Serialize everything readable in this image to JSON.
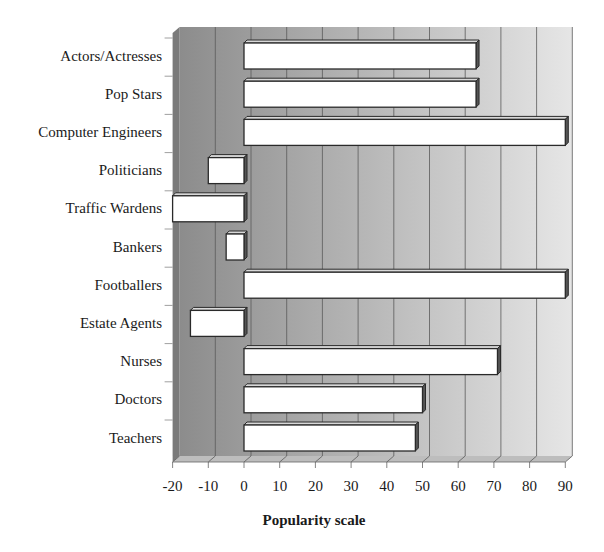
{
  "chart_data": {
    "type": "bar",
    "orientation": "horizontal",
    "style": "3d",
    "title": "",
    "xlabel": "Popularity scale",
    "ylabel": "",
    "categories": [
      "Actors/Actresses",
      "Pop Stars",
      "Computer Engineers",
      "Politicians",
      "Traffic Wardens",
      "Bankers",
      "Footballers",
      "Estate Agents",
      "Nurses",
      "Doctors",
      "Teachers"
    ],
    "values": [
      65,
      65,
      90,
      -10,
      -20,
      -5,
      90,
      -15,
      71,
      50,
      48
    ],
    "xlim": [
      -20,
      90
    ],
    "xticks": [
      "-20",
      "-10",
      "0",
      "10",
      "20",
      "30",
      "40",
      "50",
      "60",
      "70",
      "80",
      "90"
    ],
    "grid": true,
    "legend": null,
    "colors": {
      "bar_fill": "#ffffff",
      "bar_edge": "#2a2a2a",
      "wall_dark": "#8c8c8c",
      "wall_light": "#e6e6e6",
      "gridline": "#5a5a5a"
    }
  }
}
